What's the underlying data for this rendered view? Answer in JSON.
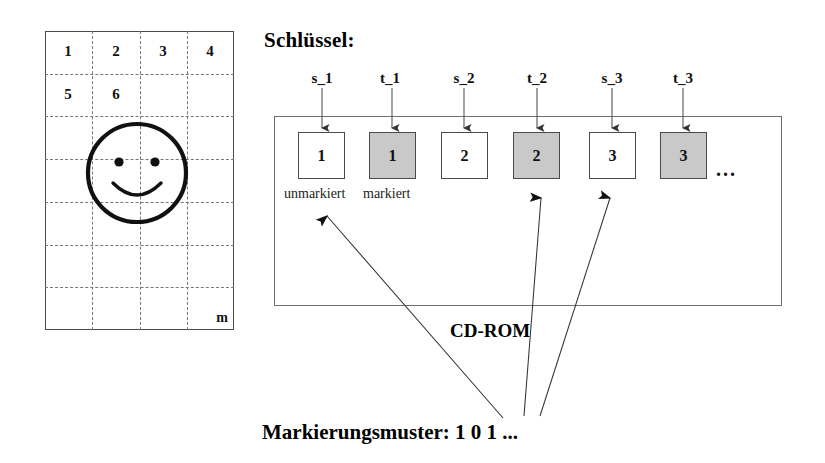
{
  "grid": {
    "cells": [
      {
        "label": "1",
        "col": 0,
        "row": 0
      },
      {
        "label": "2",
        "col": 1,
        "row": 0
      },
      {
        "label": "3",
        "col": 2,
        "row": 0
      },
      {
        "label": "4",
        "col": 3,
        "row": 0
      },
      {
        "label": "5",
        "col": 0,
        "row": 1
      },
      {
        "label": "6",
        "col": 1,
        "row": 1
      }
    ],
    "corner_label": "m",
    "columns": 4,
    "rows": 7,
    "icon": "smiley-face-icon"
  },
  "key_section": {
    "title": "Schlüssel:",
    "labels": [
      "s_1",
      "t_1",
      "s_2",
      "t_2",
      "s_3",
      "t_3"
    ]
  },
  "cdrom": {
    "caption": "CD-ROM",
    "ellipsis": "...",
    "slots": [
      {
        "value": "1",
        "state": "unmarked"
      },
      {
        "value": "1",
        "state": "marked"
      },
      {
        "value": "2",
        "state": "unmarked"
      },
      {
        "value": "2",
        "state": "marked"
      },
      {
        "value": "3",
        "state": "unmarked"
      },
      {
        "value": "3",
        "state": "marked"
      }
    ],
    "legend_unmarked": "unmarkiert",
    "legend_marked": "markiert"
  },
  "pattern": {
    "caption": "Markierungsmuster:  1 0 1 ..."
  },
  "colors": {
    "marked_fill": "#c9c9c9",
    "unmarked_fill": "#ffffff",
    "outline": "#4a4a4a",
    "dashed_grid": "#777777",
    "text": "#000000"
  }
}
